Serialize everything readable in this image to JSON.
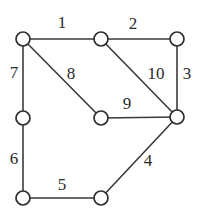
{
  "diagram": {
    "colors": {
      "background": "#ffffff",
      "edge_stroke": "#3a3a3a",
      "node_stroke": "#2e2e2e",
      "node_fill": "#ffffff",
      "label_color": "#2b2b2b"
    },
    "nodes": [
      {
        "id": "A",
        "name": "node-top-left",
        "x": 23,
        "y": 39,
        "r": 7
      },
      {
        "id": "B",
        "name": "node-top-middle",
        "x": 101,
        "y": 39,
        "r": 7
      },
      {
        "id": "C",
        "name": "node-top-right",
        "x": 177,
        "y": 39,
        "r": 7
      },
      {
        "id": "D",
        "name": "node-left-middle",
        "x": 23,
        "y": 118,
        "r": 7
      },
      {
        "id": "E",
        "name": "node-center",
        "x": 101,
        "y": 118,
        "r": 7
      },
      {
        "id": "F",
        "name": "node-right-middle",
        "x": 177,
        "y": 117,
        "r": 7
      },
      {
        "id": "G",
        "name": "node-bottom-left",
        "x": 23,
        "y": 198,
        "r": 7
      },
      {
        "id": "H",
        "name": "node-bottom-middle",
        "x": 101,
        "y": 198,
        "r": 7
      }
    ],
    "edges": [
      {
        "label": "1",
        "from": "A",
        "to": "B",
        "x1": 23,
        "y1": 39,
        "x2": 101,
        "y2": 39,
        "lx": 62,
        "ly": 22
      },
      {
        "label": "2",
        "from": "B",
        "to": "C",
        "x1": 101,
        "y1": 39,
        "x2": 177,
        "y2": 39,
        "lx": 133,
        "ly": 23
      },
      {
        "label": "3",
        "from": "C",
        "to": "F",
        "x1": 177,
        "y1": 39,
        "x2": 177,
        "y2": 117,
        "lx": 187,
        "ly": 73
      },
      {
        "label": "4",
        "from": "F",
        "to": "H",
        "x1": 177,
        "y1": 117,
        "x2": 101,
        "y2": 198,
        "lx": 148,
        "ly": 160
      },
      {
        "label": "5",
        "from": "G",
        "to": "H",
        "x1": 23,
        "y1": 198,
        "x2": 101,
        "y2": 198,
        "lx": 62,
        "ly": 184
      },
      {
        "label": "6",
        "from": "D",
        "to": "G",
        "x1": 23,
        "y1": 118,
        "x2": 23,
        "y2": 198,
        "lx": 14,
        "ly": 158
      },
      {
        "label": "7",
        "from": "A",
        "to": "D",
        "x1": 23,
        "y1": 39,
        "x2": 23,
        "y2": 118,
        "lx": 14,
        "ly": 72
      },
      {
        "label": "8",
        "from": "A",
        "to": "E",
        "x1": 23,
        "y1": 39,
        "x2": 101,
        "y2": 118,
        "lx": 71,
        "ly": 73
      },
      {
        "label": "9",
        "from": "E",
        "to": "F",
        "x1": 101,
        "y1": 118,
        "x2": 177,
        "y2": 117,
        "lx": 127,
        "ly": 103
      },
      {
        "label": "10",
        "from": "B",
        "to": "F",
        "x1": 101,
        "y1": 39,
        "x2": 177,
        "y2": 117,
        "lx": 156,
        "ly": 73
      }
    ]
  }
}
